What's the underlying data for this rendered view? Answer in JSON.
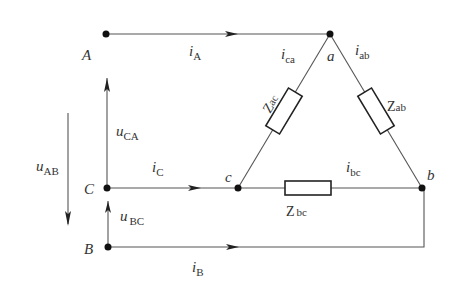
{
  "diagram": {
    "nodes": {
      "A": "A",
      "B": "B",
      "C": "C",
      "a": "a",
      "b": "b",
      "c": "c"
    },
    "currents": {
      "iA": {
        "main": "i",
        "sub": "A"
      },
      "iB": {
        "main": "i",
        "sub": "B"
      },
      "iC": {
        "main": "i",
        "sub": "C"
      },
      "iab": {
        "main": "i",
        "sub": "ab"
      },
      "ibc": {
        "main": "i",
        "sub": "bc"
      },
      "ica": {
        "main": "i",
        "sub": "ca"
      }
    },
    "voltages": {
      "uAB": {
        "main": "u",
        "sub": "AB"
      },
      "uBC": {
        "main": "u",
        "sub": "BC"
      },
      "uCA": {
        "main": "u",
        "sub": "CA"
      }
    },
    "impedances": {
      "Zab": {
        "main": "Z",
        "sub": "ab"
      },
      "Zbc": {
        "main": "Z",
        "sub": "bc"
      },
      "Zac": {
        "main": "Z",
        "sub": "ac"
      }
    },
    "colors": {
      "wire": "#555555",
      "text": "#333333",
      "node": "#111111"
    }
  }
}
